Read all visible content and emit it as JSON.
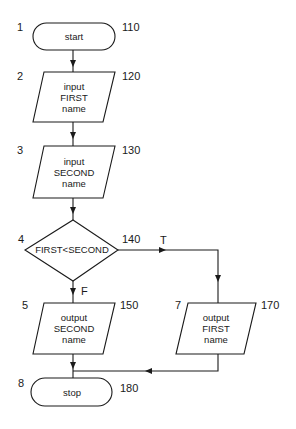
{
  "flowchart": {
    "nodes": [
      {
        "id": "start",
        "type": "terminal",
        "step": "1",
        "line": "110",
        "text": "start"
      },
      {
        "id": "input-first",
        "type": "input",
        "step": "2",
        "line": "120",
        "lines": [
          "input",
          "FIRST",
          "name"
        ]
      },
      {
        "id": "input-second",
        "type": "input",
        "step": "3",
        "line": "130",
        "lines": [
          "input",
          "SECOND",
          "name"
        ]
      },
      {
        "id": "decision",
        "type": "decision",
        "step": "4",
        "line": "140",
        "text": "FIRST<SECOND"
      },
      {
        "id": "output-second",
        "type": "output",
        "step": "5",
        "line": "150",
        "lines": [
          "output",
          "SECOND",
          "name"
        ]
      },
      {
        "id": "output-first",
        "type": "output",
        "step": "7",
        "line": "170",
        "lines": [
          "output",
          "FIRST",
          "name"
        ]
      },
      {
        "id": "stop",
        "type": "terminal",
        "step": "8",
        "line": "180",
        "text": "stop"
      }
    ],
    "branches": {
      "true_label": "T",
      "false_label": "F"
    },
    "colors": {
      "stroke": "#1a1a1a",
      "background": "#ffffff"
    }
  }
}
